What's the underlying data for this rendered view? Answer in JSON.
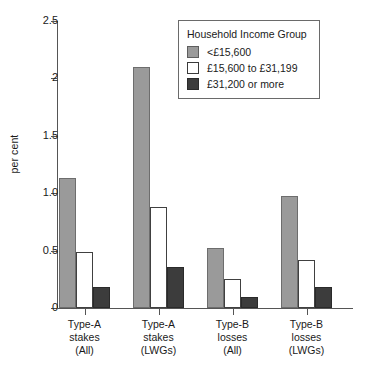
{
  "chart_data": {
    "type": "bar",
    "title": "",
    "xlabel": "",
    "ylabel": "per cent",
    "ylim": [
      0,
      2.5
    ],
    "grid": false,
    "legend_position": "top-right",
    "legend_title": "Household Income Group",
    "categories": [
      "Type-A stakes (All)",
      "Type-A stakes (LWGs)",
      "Type-B losses (All)",
      "Type-B losses (LWGs)"
    ],
    "category_lines": [
      [
        "Type-A",
        "stakes",
        "(All)"
      ],
      [
        "Type-A",
        "stakes",
        "(LWGs)"
      ],
      [
        "Type-B",
        "losses",
        "(All)"
      ],
      [
        "Type-B",
        "losses",
        "(LWGs)"
      ]
    ],
    "ytick_labels": [
      "0",
      "0.5",
      "1.0",
      "1.5",
      "2",
      "2.5"
    ],
    "ytick_values": [
      0,
      0.5,
      1.0,
      1.5,
      2.0,
      2.5
    ],
    "series": [
      {
        "name": "<£15,600",
        "color": "#9a9a9a",
        "values": [
          1.13,
          2.1,
          0.52,
          0.98
        ]
      },
      {
        "name": "£15,600 to £31,199",
        "color": "#ffffff",
        "values": [
          0.49,
          0.88,
          0.25,
          0.42
        ]
      },
      {
        "name": "£31,200 or more",
        "color": "#3c3c3c",
        "values": [
          0.18,
          0.36,
          0.1,
          0.18
        ]
      }
    ]
  }
}
